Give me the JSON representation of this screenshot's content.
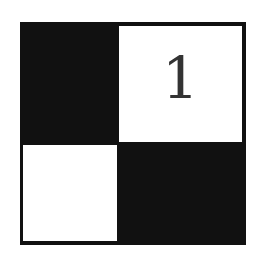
{
  "puzzle": {
    "title": "",
    "rows": 2,
    "cols": 2,
    "cells": [
      {
        "row": 0,
        "col": 0,
        "type": "black",
        "label": ""
      },
      {
        "row": 0,
        "col": 1,
        "type": "white",
        "label": "1"
      },
      {
        "row": 1,
        "col": 0,
        "type": "white",
        "label": ""
      },
      {
        "row": 1,
        "col": 1,
        "type": "black",
        "label": ""
      }
    ],
    "colors": {
      "black": "#111111",
      "white": "#ffffff",
      "number": "#333333"
    }
  }
}
